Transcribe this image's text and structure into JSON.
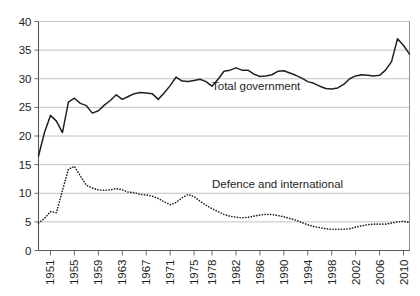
{
  "chart_data": {
    "type": "line",
    "title": "",
    "subtitle": "",
    "xlabel": "",
    "ylabel": "",
    "ylim": [
      0,
      40
    ],
    "xlim": [
      1949,
      2011
    ],
    "yticks": [
      0,
      5,
      10,
      15,
      20,
      25,
      30,
      35,
      40
    ],
    "ytick_labels": [
      "0",
      "5",
      "10",
      "15",
      "20",
      "25",
      "30",
      "35",
      "40"
    ],
    "xticks": [
      1951,
      1955,
      1959,
      1963,
      1967,
      1971,
      1975,
      1978,
      1982,
      1986,
      1990,
      1994,
      1998,
      2002,
      2006,
      2010
    ],
    "xtick_labels": [
      "1951",
      "1955",
      "1959",
      "1963",
      "1967",
      "1971",
      "1975",
      "1978",
      "1982",
      "1986",
      "1990",
      "1994",
      "1998",
      "2002",
      "2006",
      "2010"
    ],
    "grid": true,
    "grid_axis": "y",
    "legend_position": "inline-annotations",
    "x": [
      1949,
      1950,
      1951,
      1952,
      1953,
      1954,
      1955,
      1956,
      1957,
      1958,
      1959,
      1960,
      1961,
      1962,
      1963,
      1964,
      1965,
      1966,
      1967,
      1968,
      1969,
      1970,
      1971,
      1972,
      1973,
      1974,
      1975,
      1976,
      1977,
      1978,
      1979,
      1980,
      1981,
      1982,
      1983,
      1984,
      1985,
      1986,
      1987,
      1988,
      1989,
      1990,
      1991,
      1992,
      1993,
      1994,
      1995,
      1996,
      1997,
      1998,
      1999,
      2000,
      2001,
      2002,
      2003,
      2004,
      2005,
      2006,
      2007,
      2008,
      2009,
      2010,
      2011
    ],
    "series": [
      {
        "name": "Total government",
        "style": "solid",
        "color": "#231f20",
        "label_text": "Total government",
        "values": [
          16.5,
          20.6,
          23.6,
          22.6,
          20.6,
          25.9,
          26.6,
          25.7,
          25.3,
          24.0,
          24.4,
          25.4,
          26.2,
          27.2,
          26.4,
          26.9,
          27.4,
          27.6,
          27.5,
          27.4,
          26.4,
          27.5,
          28.8,
          30.3,
          29.6,
          29.5,
          29.7,
          29.9,
          29.5,
          28.7,
          29.9,
          31.3,
          31.5,
          31.9,
          31.5,
          31.5,
          30.8,
          30.4,
          30.5,
          30.7,
          31.3,
          31.4,
          31.0,
          30.6,
          30.1,
          29.5,
          29.2,
          28.7,
          28.3,
          28.2,
          28.4,
          29.0,
          30.0,
          30.5,
          30.7,
          30.6,
          30.5,
          30.6,
          31.5,
          33.0,
          37.0,
          35.8,
          34.3
        ]
      },
      {
        "name": "Defence and international",
        "style": "dotted",
        "color": "#231f20",
        "label_text": "Defence and international",
        "values": [
          4.8,
          5.6,
          6.8,
          6.6,
          10.5,
          14.2,
          14.7,
          13.0,
          11.4,
          10.9,
          10.6,
          10.5,
          10.6,
          10.8,
          10.6,
          10.2,
          10.1,
          9.8,
          9.7,
          9.5,
          9.1,
          8.5,
          8.0,
          8.4,
          9.2,
          9.8,
          9.4,
          8.6,
          7.9,
          7.3,
          6.8,
          6.3,
          6.0,
          5.8,
          5.7,
          5.8,
          6.0,
          6.2,
          6.3,
          6.3,
          6.1,
          5.9,
          5.6,
          5.3,
          4.9,
          4.5,
          4.2,
          4.0,
          3.8,
          3.7,
          3.7,
          3.7,
          3.8,
          4.1,
          4.3,
          4.5,
          4.6,
          4.6,
          4.6,
          4.8,
          5.0,
          5.1,
          4.9
        ]
      }
    ],
    "annotations": [
      {
        "text": "Total government",
        "x": 1978,
        "y": 28.0
      },
      {
        "text": "Defence and international",
        "x": 1978,
        "y": 11.0
      }
    ]
  }
}
